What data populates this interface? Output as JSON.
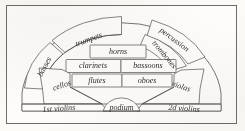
{
  "diagram": {
    "type": "orchestra-seating-chart",
    "colors": {
      "paper": "#fbfaf7",
      "ink": "#2e2c2a",
      "rule": "#55524e",
      "frame": "#6e6c68"
    },
    "sections": [
      {
        "id": "basses",
        "label": "basses",
        "row": "outer-arc",
        "side": "left",
        "rotation": -62
      },
      {
        "id": "trumpets",
        "label": "trumpets",
        "row": "outer-arc",
        "side": "left",
        "rotation": -20
      },
      {
        "id": "percussion",
        "label": "percussion",
        "row": "outer-arc",
        "side": "right",
        "rotation": 37
      },
      {
        "id": "trombones",
        "label": "trombones",
        "row": "outer-arc",
        "side": "right",
        "rotation": 50
      },
      {
        "id": "horns",
        "label": "horns",
        "row": "row-3",
        "side": "center",
        "rotation": 0
      },
      {
        "id": "clarinets",
        "label": "clarinets",
        "row": "row-2",
        "side": "left",
        "rotation": 0
      },
      {
        "id": "bassoons",
        "label": "bassoons",
        "row": "row-2",
        "side": "right",
        "rotation": 0
      },
      {
        "id": "flutes",
        "label": "flutes",
        "row": "row-1",
        "side": "left",
        "rotation": 0
      },
      {
        "id": "oboes",
        "label": "oboes",
        "row": "row-1",
        "side": "right",
        "rotation": 0
      },
      {
        "id": "cellos",
        "label": "cellos",
        "row": "inner-fan",
        "side": "left",
        "rotation": -19
      },
      {
        "id": "violas",
        "label": "violas",
        "row": "inner-fan",
        "side": "right",
        "rotation": 19
      },
      {
        "id": "first-violins",
        "label": "1st violins",
        "row": "front-fan",
        "side": "left",
        "rotation": -5
      },
      {
        "id": "podium",
        "label": "podium",
        "row": "front-fan",
        "side": "center",
        "rotation": 0
      },
      {
        "id": "second-violins",
        "label": "2d violins",
        "row": "front-fan",
        "side": "right",
        "rotation": 5
      }
    ]
  }
}
